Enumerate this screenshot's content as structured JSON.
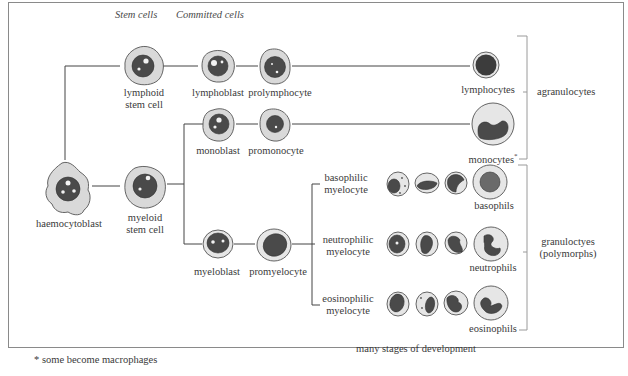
{
  "headers": {
    "stem_cells": "Stem cells",
    "committed_cells": "Committed cells"
  },
  "cells": {
    "haemocytoblast": "haemocytoblast",
    "lymphoid_stem_cell_1": "lymphoid",
    "lymphoid_stem_cell_2": "stem cell",
    "myeloid_stem_cell_1": "myeloid",
    "myeloid_stem_cell_2": "stem cell",
    "lymphoblast": "lymphoblast",
    "prolymphocyte": "prolymphocyte",
    "lymphocytes": "lymphocytes",
    "monoblast": "monoblast",
    "promonocyte": "promonocyte",
    "monocytes": "monocytes",
    "monocytes_mark": "*",
    "myeloblast": "myeloblast",
    "promyelocyte": "promyelocyte",
    "basophilic_myelocyte_1": "basophilic",
    "basophilic_myelocyte_2": "myelocyte",
    "neutrophilic_myelocyte_1": "neutrophilic",
    "neutrophilic_myelocyte_2": "myelocyte",
    "eosinophilic_myelocyte_1": "eosinophilic",
    "eosinophilic_myelocyte_2": "myelocyte",
    "basophils": "basophils",
    "neutrophils": "neutrophils",
    "eosinophils": "eosinophils"
  },
  "groups": {
    "agranulocytes": "agranulocytes",
    "granulocytes_1": "granuloctyes",
    "granulocytes_2": "(polymorphs)"
  },
  "notes": {
    "stages": "many stages of development",
    "footnote": "* some become macrophages"
  }
}
